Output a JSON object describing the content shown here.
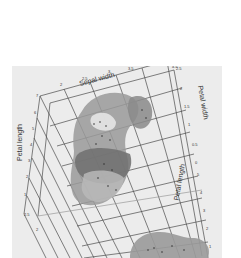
{
  "figure": {
    "type": "3d-isosurface-plot",
    "background": "#ececec",
    "axes": {
      "top": {
        "label": "Sepal width",
        "ticks": [
          "2",
          "2.5",
          "3",
          "3.5",
          "4",
          "4.5"
        ]
      },
      "left": {
        "label": "Petal length",
        "ticks": [
          "7",
          "6",
          "5",
          "4",
          "3",
          "2",
          "1"
        ],
        "corner_tick": "2.5",
        "bottom_tick": "2"
      },
      "right_upper": {
        "label": "Petal width",
        "ticks": [
          "2.5",
          "2",
          "1.5",
          "1",
          "0.5",
          "0"
        ]
      },
      "right_lower": {
        "label": "Petal length",
        "ticks": [
          "5",
          "4",
          "3",
          "2",
          "1"
        ]
      }
    },
    "colors": {
      "grid": "#4a4a4a",
      "surface_light": "#b8b8b8",
      "surface_mid": "#9a9a9a",
      "surface_dark": "#6f6f6f",
      "points": "#333333"
    }
  }
}
